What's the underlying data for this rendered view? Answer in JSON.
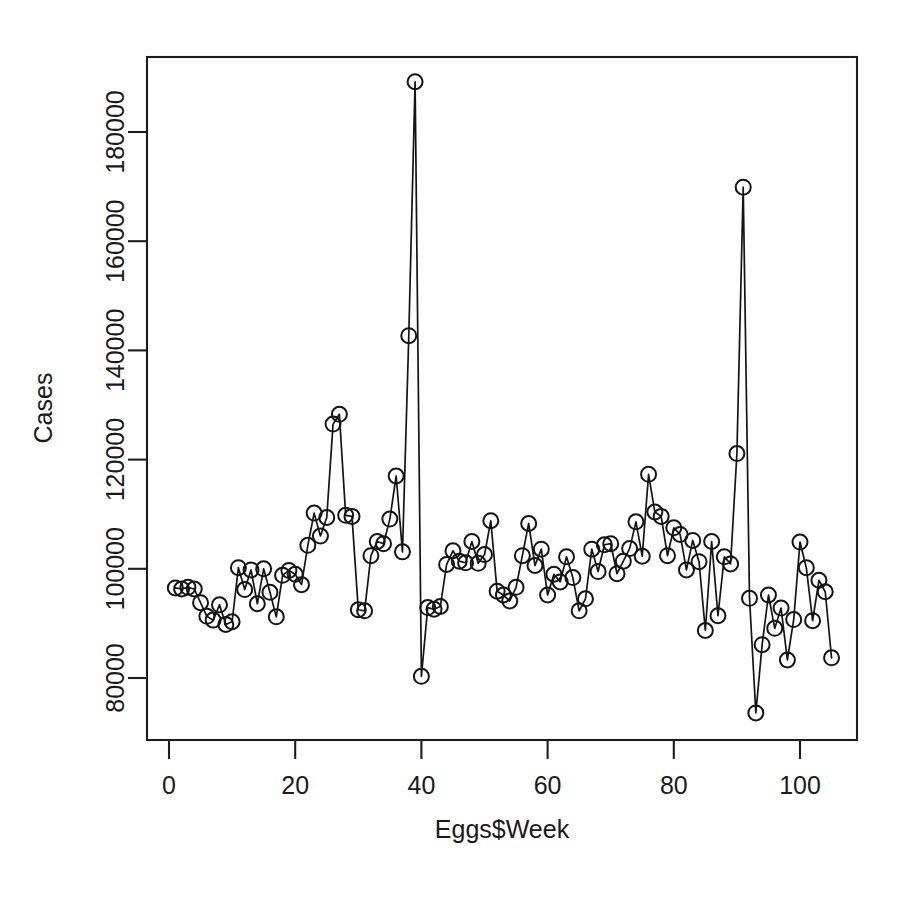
{
  "chart_data": {
    "type": "line",
    "title": "",
    "subtitle": "",
    "xlabel": "Eggs$Week",
    "ylabel": "Cases",
    "xlim": [
      -1.5,
      107
    ],
    "ylim": [
      71000,
      192500
    ],
    "grid": false,
    "legend": null,
    "marker": "open-circle",
    "line_style": "solid",
    "xticks": [
      0,
      20,
      40,
      60,
      80,
      100
    ],
    "xtick_labels": [
      "0",
      "20",
      "40",
      "60",
      "80",
      "100"
    ],
    "yticks": [
      80000,
      100000,
      120000,
      140000,
      160000,
      180000
    ],
    "ytick_labels": [
      "80000",
      "100000",
      "120000",
      "140000",
      "160000",
      "180000"
    ],
    "x": [
      1,
      2,
      3,
      4,
      5,
      6,
      7,
      8,
      9,
      10,
      11,
      12,
      13,
      14,
      15,
      16,
      17,
      18,
      19,
      20,
      21,
      22,
      23,
      24,
      25,
      26,
      27,
      28,
      29,
      30,
      31,
      32,
      33,
      34,
      35,
      36,
      37,
      38,
      39,
      40,
      41,
      42,
      43,
      44,
      45,
      46,
      47,
      48,
      49,
      50,
      51,
      52,
      53,
      54,
      55,
      56,
      57,
      58,
      59,
      60,
      61,
      62,
      63,
      64,
      65,
      66,
      67,
      68,
      69,
      70,
      71,
      72,
      73,
      74,
      75,
      76,
      77,
      78,
      79,
      80,
      81,
      82,
      83,
      84,
      85,
      86,
      87,
      88,
      89,
      90,
      91,
      92,
      93,
      94,
      95,
      96,
      97,
      98,
      99,
      100,
      101,
      102,
      103,
      104,
      105
    ],
    "y": [
      96500,
      96300,
      96600,
      96300,
      93800,
      91300,
      90600,
      93400,
      89800,
      90300,
      100200,
      96200,
      99800,
      93600,
      100000,
      95700,
      91200,
      98800,
      99700,
      99000,
      97100,
      104300,
      110200,
      106000,
      109400,
      126500,
      128300,
      109800,
      109600,
      92500,
      92300,
      102400,
      105000,
      104600,
      109100,
      117000,
      103100,
      142700,
      189200,
      80300,
      92900,
      92600,
      93100,
      100800,
      103300,
      101400,
      101100,
      105000,
      101000,
      102600,
      108800,
      95900,
      95200,
      94100,
      96600,
      102400,
      108300,
      100600,
      103600,
      95200,
      99000,
      97600,
      102200,
      98400,
      92300,
      94500,
      103600,
      99500,
      104400,
      104600,
      99100,
      101400,
      103700,
      108600,
      102300,
      117300,
      110400,
      109600,
      102400,
      107500,
      106300,
      99800,
      105200,
      101300,
      88700,
      105000,
      91400,
      102200,
      100900,
      121100,
      169900,
      94600,
      73600,
      86100,
      95200,
      89100,
      92800,
      83300,
      90700,
      104900,
      100200,
      90500,
      97900,
      95800,
      83700
    ],
    "axis_color": "#1c1c1c",
    "point_color": "#141414",
    "line_color": "#141414",
    "background": "#ffffff"
  },
  "layout": {
    "plot_box": {
      "left": 147,
      "top": 57,
      "right": 857,
      "bottom": 740
    },
    "x_pixel_at_zero": 169,
    "x_pixels_per_unit": 6.31,
    "y_pixel_at_80000": 678,
    "y_pixels_per_20000": 109.2,
    "point_radius": 7.5
  }
}
